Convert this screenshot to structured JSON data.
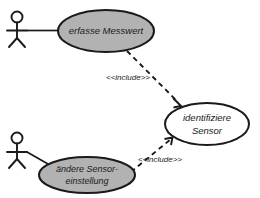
{
  "diagram": {
    "type": "uml-use-case-diagram",
    "background_color": "#ffffff",
    "line_color": "#1a1a1a",
    "shaded_fill_color": "#b2b2b2",
    "plain_fill_color": "#ffffff"
  },
  "actors": [
    {
      "id": "actor-top",
      "name": "actor-stick-figure-top",
      "label": ""
    },
    {
      "id": "actor-bottom",
      "name": "actor-stick-figure-bottom",
      "label": ""
    }
  ],
  "use_cases": [
    {
      "id": "uc-erfasse-messwert",
      "label": "erfasse Messwert",
      "lines": [
        "erfasse Messwert"
      ],
      "fill": "shaded"
    },
    {
      "id": "uc-identifiziere-sensor",
      "label": "identifiziere Sensor",
      "lines": [
        "identifiziere",
        "Sensor"
      ],
      "fill": "plain"
    },
    {
      "id": "uc-aendere-sensoreinstellung",
      "label": "ändere Sensor-einstellung",
      "lines": [
        "ändere Sensor-",
        "einstellung"
      ],
      "fill": "shaded"
    }
  ],
  "relationships": [
    {
      "id": "rel-include-top",
      "kind": "include",
      "stereotype": "<<include>>",
      "from": "uc-erfasse-messwert",
      "to": "uc-identifiziere-sensor"
    },
    {
      "id": "rel-include-bottom",
      "kind": "include",
      "stereotype": "<<include>>",
      "from": "uc-aendere-sensoreinstellung",
      "to": "uc-identifiziere-sensor"
    },
    {
      "id": "rel-assoc-top",
      "kind": "association",
      "stereotype": "",
      "from": "actor-top",
      "to": "uc-erfasse-messwert"
    },
    {
      "id": "rel-assoc-bottom",
      "kind": "association",
      "stereotype": "",
      "from": "actor-bottom",
      "to": "uc-aendere-sensoreinstellung"
    }
  ]
}
